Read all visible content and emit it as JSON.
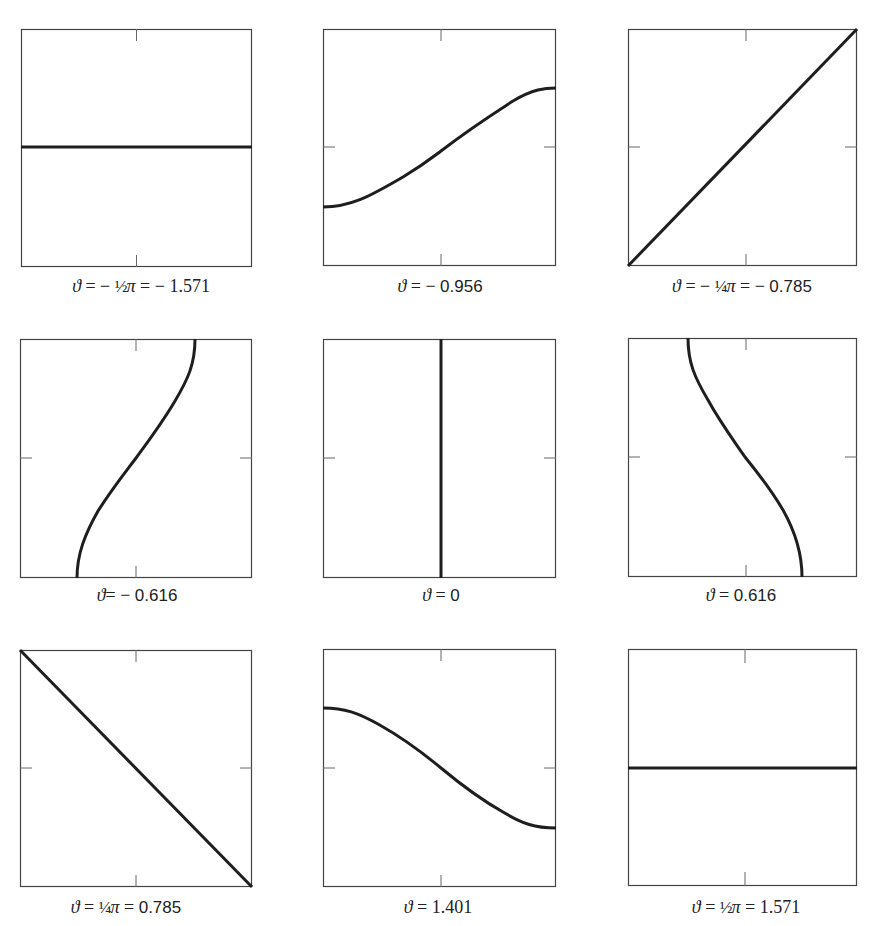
{
  "figure": {
    "panels": [
      {
        "id": "p1",
        "label": {
          "theta": "ϑ",
          "eq1": " = − ",
          "frac": "½",
          "pi": "π",
          "eq2": " = − ",
          "value": "1.571"
        },
        "box": {
          "x": 21,
          "y": 29,
          "w": 231,
          "h": 238
        },
        "ticks": [
          "top",
          "bottom"
        ],
        "curve": "horizontal"
      },
      {
        "id": "p2",
        "label": {
          "theta": "ϑ",
          "eq1": " = − ",
          "frac": "",
          "pi": "",
          "eq2": "",
          "value": "0.956"
        },
        "box": {
          "x": 323,
          "y": 29,
          "w": 233,
          "h": 237
        },
        "ticks": [
          "top",
          "bottom",
          "left",
          "right"
        ],
        "curve": "sine-rising"
      },
      {
        "id": "p3",
        "label": {
          "theta": "ϑ",
          "eq1": " = − ",
          "frac": "¼",
          "pi": "π",
          "eq2": " = − ",
          "value": "0.785"
        },
        "box": {
          "x": 628,
          "y": 29,
          "w": 229,
          "h": 237
        },
        "ticks": [
          "top",
          "bottom",
          "left",
          "right"
        ],
        "curve": "diagonal-rising"
      },
      {
        "id": "p4",
        "label": {
          "theta": "ϑ",
          "eq1": "= − ",
          "frac": "",
          "pi": "",
          "eq2": "",
          "value": "0.616"
        },
        "box": {
          "x": 20,
          "y": 339,
          "w": 232,
          "h": 239
        },
        "ticks": [
          "top",
          "bottom",
          "left",
          "right"
        ],
        "curve": "sine-vertical-rising"
      },
      {
        "id": "p5",
        "label": {
          "theta": "ϑ",
          "eq1": " = ",
          "frac": "",
          "pi": "",
          "eq2": "",
          "value": "0"
        },
        "box": {
          "x": 323,
          "y": 339,
          "w": 233,
          "h": 239
        },
        "ticks": [
          "left",
          "right"
        ],
        "curve": "vertical"
      },
      {
        "id": "p6",
        "label": {
          "theta": "ϑ",
          "eq1": " = ",
          "frac": "",
          "pi": "",
          "eq2": "",
          "value": "0.616"
        },
        "box": {
          "x": 628,
          "y": 338,
          "w": 229,
          "h": 239
        },
        "ticks": [
          "top",
          "bottom",
          "left",
          "right"
        ],
        "curve": "sine-vertical-falling"
      },
      {
        "id": "p7",
        "label": {
          "theta": "ϑ",
          "eq1": " = ",
          "frac": "¼",
          "pi": "π",
          "eq2": " = ",
          "value": "0.785"
        },
        "box": {
          "x": 20,
          "y": 650,
          "w": 232,
          "h": 237
        },
        "ticks": [
          "top",
          "bottom",
          "left",
          "right"
        ],
        "curve": "diagonal-falling"
      },
      {
        "id": "p8",
        "label": {
          "theta": "ϑ",
          "eq1": " = ",
          "frac": "",
          "pi": "",
          "eq2": "",
          "value": "1.401"
        },
        "box": {
          "x": 323,
          "y": 649,
          "w": 233,
          "h": 238
        },
        "ticks": [
          "top",
          "bottom",
          "left",
          "right"
        ],
        "curve": "sine-falling"
      },
      {
        "id": "p9",
        "label": {
          "theta": "ϑ",
          "eq1": " = ",
          "frac": "½",
          "pi": "π",
          "eq2": " = ",
          "value": "1.571"
        },
        "box": {
          "x": 628,
          "y": 649,
          "w": 229,
          "h": 237
        },
        "ticks": [
          "top",
          "bottom"
        ],
        "curve": "horizontal"
      }
    ],
    "labels_text": [
      "ϑ = −½π = −1.571",
      "ϑ = − 0.956",
      "ϑ = −¼π = − 0.785",
      "ϑ = − 0.616",
      "ϑ = 0",
      "ϑ = 0.616",
      "ϑ = ¼π = 0.785",
      "ϑ = 1.401",
      "ϑ = ½π = 1.571"
    ],
    "style": {
      "border_color": "#444444",
      "curve_color": "#1e1e1e",
      "curve_width": 3,
      "tick_length": 11
    }
  }
}
